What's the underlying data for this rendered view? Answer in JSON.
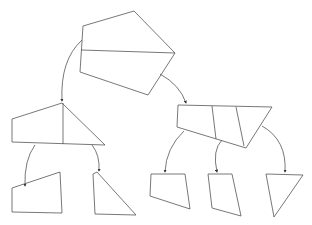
{
  "diagram": {
    "type": "tree",
    "nodes": [
      {
        "id": "root",
        "shape": "pentagon",
        "points": "83,26 134,11 175,53 148,95 80,72",
        "dividers": [
          "81,50 175,53"
        ]
      },
      {
        "id": "left-mid",
        "shape": "quad-split",
        "points": "12,119 62,103 105,145 12,142",
        "dividers": [
          "63,103 63,144"
        ]
      },
      {
        "id": "right-mid",
        "shape": "quad-split",
        "points": "178,105 272,107 246,148 177,127",
        "dividers": [
          "212,106 216,139",
          "236,107 244,146"
        ]
      },
      {
        "id": "leaf-1",
        "shape": "quad",
        "points": "12,188 60,172 62,213 12,212",
        "dividers": []
      },
      {
        "id": "leaf-2",
        "shape": "triangle",
        "points": "93,174 97,172 136,215 95,214",
        "dividers": []
      },
      {
        "id": "leaf-3",
        "shape": "quad",
        "points": "151,174 185,174 190,209 150,196",
        "dividers": []
      },
      {
        "id": "leaf-4",
        "shape": "quad",
        "points": "208,174 232,174 241,216 212,208",
        "dividers": []
      },
      {
        "id": "leaf-5",
        "shape": "triangle",
        "points": "266,174 303,175 274,217",
        "dividers": []
      }
    ],
    "edges": [
      {
        "from": "root",
        "to": "left-mid",
        "path": "M82,40 Q60,60 62,101"
      },
      {
        "from": "root",
        "to": "right-mid",
        "path": "M160,74 Q180,85 186,103"
      },
      {
        "from": "left-mid",
        "to": "leaf-1",
        "path": "M35,145 Q24,160 25,186"
      },
      {
        "from": "left-mid",
        "to": "leaf-2",
        "path": "M92,145 Q100,155 99,171"
      },
      {
        "from": "right-mid",
        "to": "leaf-3",
        "path": "M184,131 Q166,148 165,172"
      },
      {
        "from": "right-mid",
        "to": "leaf-4",
        "path": "M222,140 Q212,150 217,172"
      },
      {
        "from": "right-mid",
        "to": "leaf-5",
        "path": "M262,126 Q287,140 285,172"
      }
    ]
  }
}
